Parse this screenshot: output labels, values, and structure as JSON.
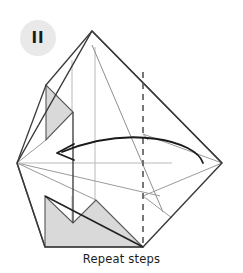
{
  "step": {
    "badge_label": "II",
    "badge_icon": "step-number-badge",
    "badge_bg": "#e9e9e9",
    "badge_fg": "#1a1a1a"
  },
  "caption": {
    "text": "Repeat steps"
  },
  "colors": {
    "background": "#ffffff",
    "outline": "#3a3a3a",
    "outline_dark": "#222222",
    "crease_light": "#b9b9b9",
    "crease_mid": "#8f8f8f",
    "shade_fill": "#d9d9d9",
    "shade_stroke": "#555555",
    "arrow": "#1a1a1a",
    "dashed": "#555555"
  },
  "diagram": {
    "name": "paper-fold-step-diagram",
    "type": "origami-instruction",
    "viewbox": "0 0 243 258",
    "outline_path": "M92,31 L222,163 L143,247 L45,247 L17,163 Z",
    "shapes": [
      {
        "name": "main-body-outline",
        "kind": "polygon",
        "points": "92,31 222,163 143,247 45,247 17,163",
        "fill": "none",
        "stroke": "#3a3a3a",
        "stroke_width": 1.4
      },
      {
        "name": "left-shaded-flap",
        "kind": "polygon",
        "points": "46,85 46,140 73,112",
        "fill": "#d9d9d9",
        "stroke": "#555555",
        "stroke_width": 1.2
      },
      {
        "name": "bottom-shaded-flap",
        "kind": "polygon",
        "points": "45,196 45,247 143,247 96,200 73,223",
        "fill": "#d9d9d9",
        "stroke": "#555555",
        "stroke_width": 1.2
      },
      {
        "name": "bottom-left-diagonal-fold",
        "kind": "line",
        "points": "45,196 143,247",
        "stroke": "#222222",
        "stroke_width": 1.5
      },
      {
        "name": "left-upper-edge",
        "kind": "line",
        "points": "46,85 17,163",
        "stroke": "#3a3a3a",
        "stroke_width": 1.2
      },
      {
        "name": "left-lower-edge",
        "kind": "line",
        "points": "17,163 45,247",
        "stroke": "#3a3a3a",
        "stroke_width": 1.2
      },
      {
        "name": "left-vertical-fold",
        "kind": "line",
        "points": "73,112 73,223",
        "stroke": "#444444",
        "stroke_width": 1.3
      },
      {
        "name": "right-inner-fold-upper",
        "kind": "line",
        "points": "92,31 222,163",
        "stroke": "#3a3a3a",
        "stroke_width": 1.3
      }
    ],
    "creases": [
      {
        "name": "crease-vertical-left",
        "points": "72,60 72,112",
        "stroke": "#b9b9b9"
      },
      {
        "name": "crease-vertical-center",
        "points": "95,47 95,240",
        "stroke": "#b9b9b9"
      },
      {
        "name": "crease-vertical-inner",
        "points": "72,196 72,247",
        "stroke": "#b9b9b9"
      },
      {
        "name": "crease-diagonal-apex-right",
        "points": "92,45 163,212",
        "stroke": "#8f8f8f"
      },
      {
        "name": "crease-diagonal-left-to-right",
        "points": "17,163 160,196",
        "stroke": "#8f8f8f"
      },
      {
        "name": "crease-diagonal-left-up",
        "points": "17,163 96,200",
        "stroke": "#8f8f8f"
      },
      {
        "name": "crease-horizontal-mid",
        "points": "17,163 170,163",
        "stroke": "#b9b9b9"
      },
      {
        "name": "crease-right-upper",
        "points": "143,134 222,163",
        "stroke": "#8f8f8f"
      },
      {
        "name": "crease-right-lower",
        "points": "143,196 222,163",
        "stroke": "#8f8f8f"
      },
      {
        "name": "crease-upper-flap",
        "points": "46,85 92,31",
        "stroke": "#3a3a3a"
      },
      {
        "name": "crease-short-right",
        "points": "143,134 143,196",
        "stroke": "#9a9a9a"
      }
    ],
    "dashed_fold": {
      "name": "dashed-fold-line",
      "points": "143,72 143,247",
      "stroke": "#555555",
      "stroke_width": 1.6,
      "dash": "6,5"
    },
    "arrow": {
      "name": "fold-direction-arrow",
      "curve": "M203,163 C190,140 120,126 60,152",
      "head": "70,145 56,153 72,159",
      "stroke": "#1a1a1a",
      "stroke_width": 1.8,
      "direction": "right-to-left"
    }
  }
}
